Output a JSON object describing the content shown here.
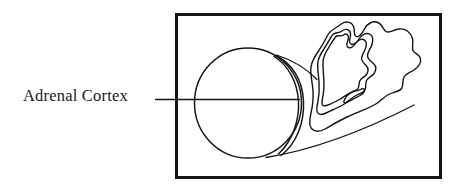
{
  "figure": {
    "kind": "anatomical-diagram",
    "title": "Adrenal Cortex",
    "label": "Adrenal Cortex",
    "background_color": "#ffffff",
    "ink_color": "#141414",
    "frame": {
      "name": "diagram-frame",
      "x": 175,
      "y": 13,
      "width": 266,
      "height": 165,
      "stroke_width": 3,
      "stroke_color": "#141414",
      "fill": "none"
    },
    "leader_line": {
      "name": "leader-line",
      "x1": 155,
      "y1": 99,
      "x2": 300,
      "y2": 99,
      "stroke_width": 1.6,
      "stroke_color": "#141414"
    },
    "gland_body": {
      "name": "adrenal-gland-cylinder",
      "shape": "circle-with-elliptical-end-cap",
      "center_x": 248,
      "center_y": 103,
      "radius_x": 54,
      "radius_y": 55,
      "cap_offset": 9,
      "stroke_width": 1.4,
      "stroke_color": "#141414",
      "fill": "none"
    },
    "magnified_section": {
      "name": "cortex-cross-section",
      "description": "magnified irregular cross-section with nested contours",
      "contour_count": 3,
      "inner_detail": "small closed arrowhead inclusion",
      "stroke_width": 1.4,
      "stroke_color": "#141414",
      "fill": "none"
    },
    "callout_connectors": {
      "name": "magnification-connectors",
      "count": 2,
      "stroke_width": 1.3,
      "stroke_color": "#141414"
    }
  }
}
